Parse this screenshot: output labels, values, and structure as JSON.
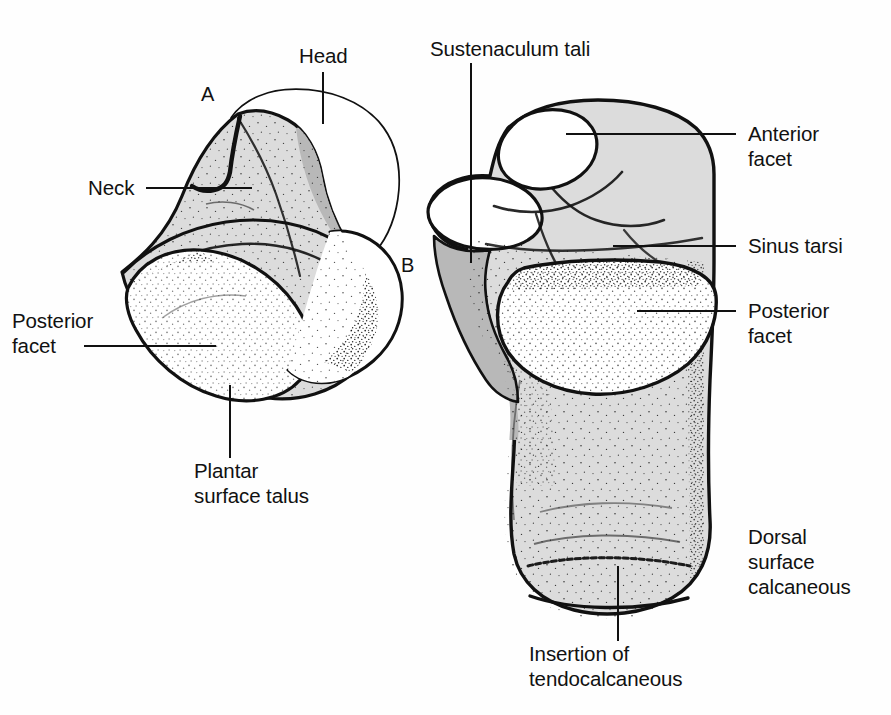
{
  "figure": {
    "background_color": "#fefefe",
    "ink_color": "#111111",
    "bone_fill_light": "#dcdcdc",
    "bone_fill_mid": "#b8b8b8",
    "bone_fill_white": "#ffffff",
    "panels": [
      {
        "letter": "A",
        "subject": "talus",
        "view": "plantar surface of talus"
      },
      {
        "letter": "B",
        "subject": "calcaneus",
        "view": "dorsal surface of calcaneus"
      }
    ],
    "annotations": [
      {
        "id": "head",
        "text": "Head",
        "panel": "A",
        "leader": "vertical"
      },
      {
        "id": "neck",
        "text": "Neck",
        "panel": "A",
        "leader": "horizontal"
      },
      {
        "id": "posterior-facet-talus",
        "line1": "Posterior",
        "line2": "facet",
        "panel": "A",
        "leader": "horizontal"
      },
      {
        "id": "plantar-surface-talus",
        "line1": "Plantar",
        "line2": "surface talus",
        "panel": "A",
        "leader": "vertical"
      },
      {
        "id": "sustenaculum-tali",
        "text": "Sustenaculum tali",
        "panel": "B",
        "leader": "vertical"
      },
      {
        "id": "anterior-facet",
        "line1": "Anterior",
        "line2": "facet",
        "panel": "B",
        "leader": "horizontal"
      },
      {
        "id": "sinus-tarsi",
        "text": "Sinus tarsi",
        "panel": "B",
        "leader": "horizontal"
      },
      {
        "id": "posterior-facet-calcaneus",
        "line1": "Posterior",
        "line2": "facet",
        "panel": "B",
        "leader": "horizontal"
      },
      {
        "id": "dorsal-surface-calcaneous",
        "line1": "Dorsal",
        "line2": "surface",
        "line3": "calcaneous",
        "panel": "B",
        "leader": "none"
      },
      {
        "id": "insertion-of-tendocalcaneous",
        "line1": "Insertion of",
        "line2": "tendocalcaneous",
        "panel": "B",
        "leader": "vertical"
      }
    ]
  },
  "labels": {
    "head": "Head",
    "neck": "Neck",
    "posterior_facet_talus_l1": "Posterior",
    "posterior_facet_talus_l2": "facet",
    "plantar_surface_talus_l1": "Plantar",
    "plantar_surface_talus_l2": "surface talus",
    "sustenaculum_tali": "Sustenaculum tali",
    "anterior_facet_l1": "Anterior",
    "anterior_facet_l2": "facet",
    "sinus_tarsi": "Sinus tarsi",
    "posterior_facet_calcaneus_l1": "Posterior",
    "posterior_facet_calcaneus_l2": "facet",
    "dorsal_surface_l1": "Dorsal",
    "dorsal_surface_l2": "surface",
    "dorsal_surface_l3": "calcaneous",
    "insertion_l1": "Insertion of",
    "insertion_l2": "tendocalcaneous",
    "panel_a": "A",
    "panel_b": "B"
  }
}
